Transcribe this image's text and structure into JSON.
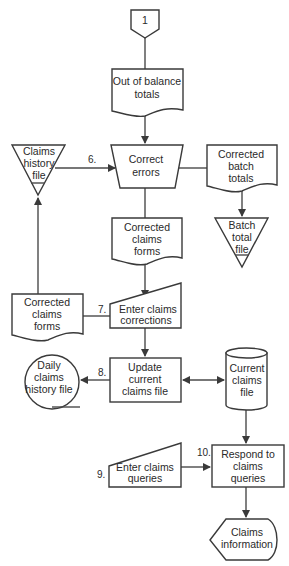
{
  "diagram": {
    "type": "system flowchart",
    "nodes": {
      "connector": {
        "label": "1",
        "shape": "off-page-connector"
      },
      "out_of_balance": {
        "line1": "Out of  balance",
        "line2": "totals",
        "shape": "document"
      },
      "claims_history": {
        "line1": "Claims",
        "line2": "history",
        "line3": "file",
        "shape": "offline-storage"
      },
      "correct_errors": {
        "line1": "Correct",
        "line2": "errors",
        "shape": "manual-operation"
      },
      "corrected_batch": {
        "line1": "Corrected",
        "line2": "batch",
        "line3": "totals",
        "shape": "document"
      },
      "batch_total_file": {
        "line1": "Batch",
        "line2": "total",
        "line3": "file",
        "shape": "offline-storage"
      },
      "corrected_claims_center": {
        "line1": "Corrected",
        "line2": "claims",
        "line3": "forms",
        "shape": "document"
      },
      "corrected_claims_left": {
        "line1": "Corrected",
        "line2": "claims",
        "line3": "forms",
        "shape": "document"
      },
      "enter_corrections": {
        "line1": "Enter claims",
        "line2": "corrections",
        "shape": "manual-input"
      },
      "daily_history": {
        "line1": "Daily",
        "line2": "claims",
        "line3": "history file",
        "shape": "magnetic-tape"
      },
      "update_file": {
        "line1": "Update",
        "line2": "current",
        "line3": "claims file",
        "shape": "process"
      },
      "current_file": {
        "line1": "Current",
        "line2": "claims",
        "line3": "file",
        "shape": "disk-storage"
      },
      "enter_queries": {
        "line1": "Enter claims",
        "line2": "queries",
        "shape": "manual-input"
      },
      "respond_queries": {
        "line1": "Respond to",
        "line2": "claims",
        "line3": "queries",
        "shape": "process"
      },
      "claims_info": {
        "line1": "Claims",
        "line2": "information",
        "shape": "display"
      }
    },
    "step_numbers": {
      "s6": "6.",
      "s7": "7.",
      "s8": "8.",
      "s9": "9.",
      "s10": "10."
    },
    "colors": {
      "stroke": "#3a3a3a",
      "background": "#ffffff",
      "text": "#2a2a2a"
    }
  }
}
